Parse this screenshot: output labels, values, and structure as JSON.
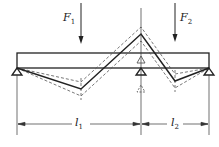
{
  "diagram": {
    "type": "continuous-beam-influence-lines",
    "loads": [
      {
        "label": "F",
        "sub": "1",
        "x": 81
      },
      {
        "label": "F",
        "sub": "2",
        "x": 175
      }
    ],
    "spans": [
      {
        "label": "l",
        "sub": "1"
      },
      {
        "label": "l",
        "sub": "2"
      }
    ],
    "supports": [
      {
        "name": "left-support",
        "x": 17
      },
      {
        "name": "middle-support",
        "x": 141
      },
      {
        "name": "right-support",
        "x": 209
      }
    ],
    "colors": {
      "line": "#222222",
      "dashed": "#555555",
      "background": "#ffffff"
    }
  }
}
